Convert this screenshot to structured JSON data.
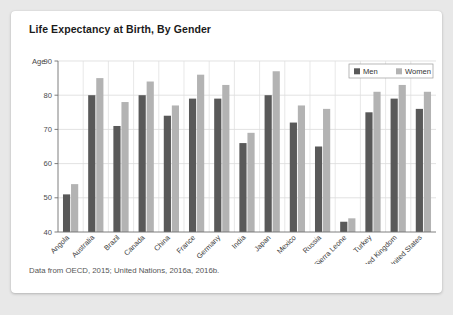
{
  "card": {
    "title": "Life Expectancy at Birth, By Gender",
    "footnote": "Data from OECD, 2015; United Nations, 2016a, 2016b."
  },
  "chart_data": {
    "type": "bar",
    "title": "Life Expectancy at Birth, By Gender",
    "xlabel": "",
    "ylabel": "Age",
    "ylim": [
      40,
      90
    ],
    "yticks": [
      40,
      50,
      60,
      70,
      80,
      90
    ],
    "grid": true,
    "legend_position": "top-right",
    "categories": [
      "Angola",
      "Australia",
      "Brazil",
      "Canada",
      "China",
      "France",
      "Germany",
      "India",
      "Japan",
      "Mexico",
      "Russia",
      "Sierra Leone",
      "Turkey",
      "United Kingdom",
      "United States"
    ],
    "series": [
      {
        "name": "Men",
        "color": "#595959",
        "values": [
          51,
          80,
          71,
          80,
          74,
          79,
          79,
          66,
          80,
          72,
          65,
          43,
          75,
          79,
          76
        ]
      },
      {
        "name": "Women",
        "color": "#b3b3b3",
        "values": [
          54,
          85,
          78,
          84,
          77,
          86,
          83,
          69,
          87,
          77,
          76,
          44,
          81,
          83,
          81
        ]
      }
    ]
  }
}
